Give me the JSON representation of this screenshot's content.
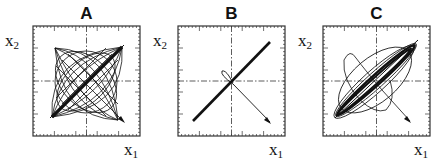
{
  "figure": {
    "panels": [
      {
        "id": "A",
        "title": "A",
        "xlabel": "x",
        "xlabel_sub": "1",
        "ylabel": "x",
        "ylabel_sub": "2",
        "description": "Many crossing oscillating trajectories (Lissajous-like) converging to a dense diagonal line; starts at lower-right arrowhead"
      },
      {
        "id": "B",
        "title": "B",
        "xlabel": "x",
        "xlabel_sub": "1",
        "ylabel": "x",
        "ylabel_sub": "2",
        "description": "Trajectory from lower-right arrowhead crosses to center with small loop, then collapses onto a single thick diagonal line"
      },
      {
        "id": "C",
        "title": "C",
        "xlabel": "x",
        "xlabel_sub": "1",
        "ylabel": "x",
        "ylabel_sub": "2",
        "description": "Trajectory from lower-right arrowhead makes large elliptical loops that narrow onto a dense diagonal band"
      }
    ],
    "axes": {
      "crosshair_style": "dash-dot",
      "ticks": "minor ticks on all four sides, major ticks every fifth"
    },
    "colors": {
      "line": "#111111",
      "frame": "#333333",
      "background": "#ffffff"
    }
  }
}
